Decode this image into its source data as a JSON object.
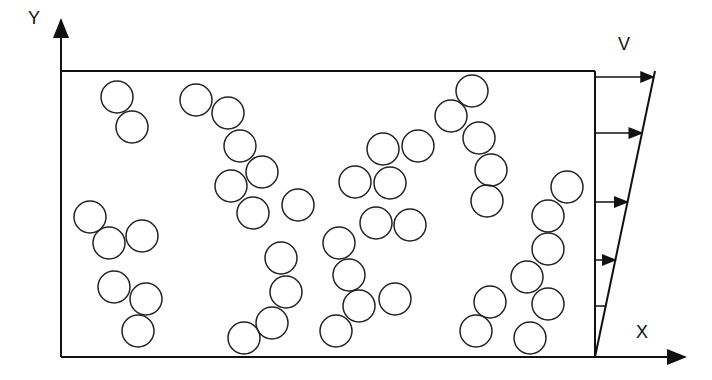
{
  "labels": {
    "y": "Y",
    "x": "X",
    "v": "V"
  },
  "circles": [
    [
      117,
      97
    ],
    [
      132,
      127
    ],
    [
      196,
      100
    ],
    [
      228,
      113
    ],
    [
      240,
      146
    ],
    [
      262,
      172
    ],
    [
      231,
      186
    ],
    [
      253,
      213
    ],
    [
      298,
      205
    ],
    [
      90,
      217
    ],
    [
      109,
      243
    ],
    [
      142,
      236
    ],
    [
      114,
      287
    ],
    [
      146,
      299
    ],
    [
      138,
      331
    ],
    [
      281,
      258
    ],
    [
      286,
      292
    ],
    [
      272,
      323
    ],
    [
      244,
      338
    ],
    [
      339,
      243
    ],
    [
      349,
      275
    ],
    [
      359,
      306
    ],
    [
      336,
      331
    ],
    [
      395,
      299
    ],
    [
      383,
      149
    ],
    [
      418,
      146
    ],
    [
      355,
      182
    ],
    [
      390,
      183
    ],
    [
      376,
      223
    ],
    [
      410,
      225
    ],
    [
      472,
      91
    ],
    [
      451,
      116
    ],
    [
      479,
      138
    ],
    [
      491,
      170
    ],
    [
      487,
      201
    ],
    [
      567,
      187
    ],
    [
      548,
      216
    ],
    [
      548,
      249
    ],
    [
      527,
      277
    ],
    [
      548,
      304
    ],
    [
      530,
      338
    ],
    [
      490,
      302
    ],
    [
      476,
      331
    ]
  ],
  "arrows_y": [
    77,
    133,
    202,
    260
  ]
}
